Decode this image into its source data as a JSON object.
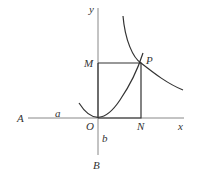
{
  "diagram": {
    "labels": {
      "y_axis": "y",
      "x_axis": "x",
      "M": "M",
      "P": "P",
      "A": "A",
      "a": "a",
      "O": "O",
      "N": "N",
      "b": "b",
      "B": "B"
    },
    "colors": {
      "axis": "#888888",
      "curve": "#333333",
      "rectangle": "#333333",
      "label": "#333333"
    },
    "points": {
      "O": [
        98,
        118
      ],
      "M": [
        98,
        63
      ],
      "P": [
        141,
        63
      ],
      "N": [
        141,
        118
      ],
      "A": [
        22,
        118
      ],
      "B": [
        98,
        162
      ]
    }
  }
}
